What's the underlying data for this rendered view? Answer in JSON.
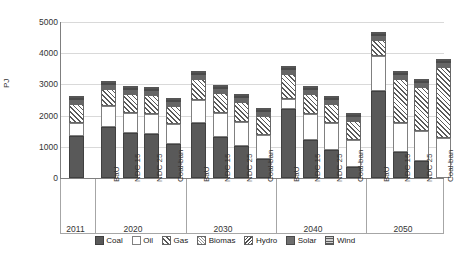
{
  "chart_data": {
    "type": "bar",
    "title": "",
    "subtitle": "",
    "stacked": true,
    "xlabel": "",
    "ylabel": "PJ",
    "ylim": [
      0,
      5000
    ],
    "ytick_step": 1000,
    "yticks": [
      "0",
      "1000",
      "2000",
      "3000",
      "4000",
      "5000"
    ],
    "grid": true,
    "legend_position": "bottom",
    "group_labels": [
      "2011",
      "2020",
      "2030",
      "2040",
      "2050"
    ],
    "scenario_labels": [
      "BaU",
      "NDC 15",
      "NDC 25",
      "Coal-ban"
    ],
    "categories": [
      "2011",
      "2020 BaU",
      "2020 NDC 15",
      "2020 NDC 25",
      "2020 Coal-ban",
      "2030 BaU",
      "2030 NDC 15",
      "2030 NDC 25",
      "2030 Coal-ban",
      "2040 BaU",
      "2040 NDC 15",
      "2040 NDC 25",
      "2040 Coal-ban",
      "2050 BaU",
      "2050 NDC 15",
      "2050 NDC 25",
      "2050 Coal-ban"
    ],
    "series": [
      {
        "name": "Coal",
        "values": [
          1350,
          1650,
          1430,
          1410,
          1100,
          1760,
          1300,
          1020,
          620,
          2200,
          1230,
          900,
          360,
          2800,
          830,
          560,
          0
        ]
      },
      {
        "name": "Oil",
        "values": [
          400,
          650,
          650,
          640,
          640,
          740,
          770,
          760,
          760,
          340,
          830,
          860,
          860,
          1100,
          920,
          940,
          1270
        ]
      },
      {
        "name": "Gas",
        "values": [
          620,
          550,
          600,
          600,
          570,
          670,
          640,
          660,
          620,
          780,
          620,
          620,
          600,
          530,
          1420,
          1420,
          2300
        ]
      },
      {
        "name": "Biomas",
        "values": [
          80,
          60,
          50,
          50,
          50,
          60,
          50,
          50,
          50,
          60,
          50,
          50,
          50,
          60,
          50,
          50,
          50
        ]
      },
      {
        "name": "Hydro",
        "values": [
          20,
          15,
          15,
          15,
          15,
          15,
          15,
          15,
          15,
          15,
          15,
          15,
          15,
          15,
          15,
          15,
          15
        ]
      },
      {
        "name": "Solar",
        "values": [
          15,
          15,
          15,
          15,
          15,
          15,
          15,
          15,
          15,
          15,
          15,
          15,
          15,
          15,
          15,
          15,
          15
        ]
      },
      {
        "name": "Wind",
        "values": [
          10,
          10,
          10,
          10,
          10,
          10,
          10,
          10,
          10,
          10,
          10,
          10,
          10,
          10,
          10,
          10,
          10
        ]
      }
    ],
    "totals": [
      2495,
      2950,
      2770,
      2740,
      2400,
      3270,
      2800,
      2530,
      2090,
      3410,
      2775,
      2470,
      1910,
      4520,
      3260,
      3010,
      3660
    ]
  },
  "legend": {
    "items": [
      {
        "label": "Coal",
        "key": "coal",
        "pattern": "solid-dark",
        "color": "#595959"
      },
      {
        "label": "Oil",
        "key": "oil",
        "pattern": "empty",
        "color": "#ffffff"
      },
      {
        "label": "Gas",
        "key": "gas",
        "pattern": "diagonal-up",
        "color": "#595959"
      },
      {
        "label": "Biomas",
        "key": "biomas",
        "pattern": "crosshatch",
        "color": "#9a9a9a"
      },
      {
        "label": "Hydro",
        "key": "hydro",
        "pattern": "diagonal-dn",
        "color": "#4d4d4d"
      },
      {
        "label": "Solar",
        "key": "solar",
        "pattern": "solid-mid",
        "color": "#6e6e6e"
      },
      {
        "label": "Wind",
        "key": "wind",
        "pattern": "horizontal",
        "color": "#5a5a5a"
      }
    ]
  }
}
